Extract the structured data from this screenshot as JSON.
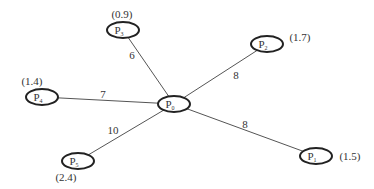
{
  "diagram": {
    "type": "star-graph",
    "center": {
      "id": "P0",
      "base": "P",
      "sub": "0",
      "x": 174,
      "y": 104
    },
    "nodes": [
      {
        "id": "P1",
        "base": "P",
        "sub": "1",
        "weight": "(1.5)",
        "x": 316,
        "y": 156,
        "wx": 350,
        "wy": 160
      },
      {
        "id": "P2",
        "base": "P",
        "sub": "2",
        "weight": "(1.7)",
        "x": 267,
        "y": 44,
        "wx": 300,
        "wy": 41
      },
      {
        "id": "P3",
        "base": "P",
        "sub": "3",
        "weight": "(0.9)",
        "x": 123,
        "y": 30,
        "wx": 122,
        "wy": 18
      },
      {
        "id": "P4",
        "base": "P",
        "sub": "4",
        "weight": "(1.4)",
        "x": 42,
        "y": 97,
        "wx": 32,
        "wy": 85
      },
      {
        "id": "P5",
        "base": "P",
        "sub": "5",
        "weight": "(2.4)",
        "x": 78,
        "y": 161,
        "wx": 66,
        "wy": 181
      }
    ],
    "edges": [
      {
        "from": "P0",
        "to": "P1",
        "label": "8",
        "lx": 245,
        "ly": 128
      },
      {
        "from": "P0",
        "to": "P2",
        "label": "8",
        "lx": 236,
        "ly": 79
      },
      {
        "from": "P0",
        "to": "P3",
        "label": "6",
        "lx": 132,
        "ly": 59
      },
      {
        "from": "P0",
        "to": "P4",
        "label": "7",
        "lx": 103,
        "ly": 98
      },
      {
        "from": "P0",
        "to": "P5",
        "label": "10",
        "lx": 113,
        "ly": 134
      }
    ]
  }
}
